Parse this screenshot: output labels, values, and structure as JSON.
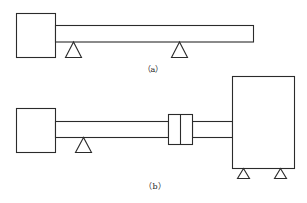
{
  "figure": {
    "subfigures": [
      {
        "id": "a",
        "label": "（a）",
        "components": [
          "motor-box",
          "shaft",
          "support-1",
          "support-2"
        ]
      },
      {
        "id": "b",
        "label": "（b）",
        "components": [
          "motor-box",
          "shaft-left",
          "support",
          "coupling",
          "shaft-right",
          "load-box",
          "load-support-1",
          "load-support-2"
        ]
      }
    ]
  },
  "colors": {
    "line": "#2b2b2b",
    "background": "#ffffff"
  }
}
